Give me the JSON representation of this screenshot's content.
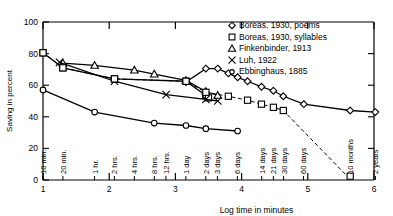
{
  "figure": {
    "y_axis_title": "Saving in percent",
    "x_axis_title": "Log time in minutes",
    "y_ticks": [
      "0",
      "20",
      "40",
      "60",
      "80",
      "100"
    ],
    "y_tick_values": [
      0,
      20,
      40,
      60,
      80,
      100
    ],
    "x_ticks": [
      "1",
      "2",
      "3",
      "4",
      "5",
      "6"
    ],
    "x_tick_values": [
      1,
      2,
      3,
      4,
      5,
      6
    ],
    "x_category_labels": [
      {
        "label": "10 min.",
        "log": 1.0
      },
      {
        "label": "20 min.",
        "log": 1.301
      },
      {
        "label": "1 hr.",
        "log": 1.778
      },
      {
        "label": "2 hrs.",
        "log": 2.079
      },
      {
        "label": "4 hrs.",
        "log": 2.38
      },
      {
        "label": "8 hrs.",
        "log": 2.681
      },
      {
        "label": "12 hrs.",
        "log": 2.857
      },
      {
        "label": "1 day",
        "log": 3.158
      },
      {
        "label": "2 days",
        "log": 3.459
      },
      {
        "label": "3 days",
        "log": 3.635
      },
      {
        "label": "6 days",
        "log": 3.936
      },
      {
        "label": "14 days",
        "log": 4.304
      },
      {
        "label": "21 days",
        "log": 4.48
      },
      {
        "label": "30 days",
        "log": 4.634
      },
      {
        "label": "60 days",
        "log": 4.935
      },
      {
        "label": "10 months",
        "log": 5.637
      },
      {
        "label": "2 years",
        "log": 6.021
      }
    ]
  },
  "legend": {
    "entries": [
      {
        "label": "Boreas, 1930, poems",
        "marker": "diamond"
      },
      {
        "label": "Boreas, 1930, syllables",
        "marker": "square"
      },
      {
        "label": "Finkenbinder, 1913",
        "marker": "triangle"
      },
      {
        "label": "Luh, 1922",
        "marker": "cross"
      },
      {
        "label": "Ebbinghaus, 1885",
        "marker": "circle-small"
      }
    ]
  },
  "chart_data": {
    "type": "line",
    "title": "",
    "xlabel": "Log time in minutes",
    "ylabel": "Saving in percent",
    "xlim": [
      1,
      6
    ],
    "ylim": [
      0,
      100
    ],
    "grid": false,
    "legend_position": "top-right",
    "x_is_log_minutes": true,
    "series": [
      {
        "name": "Boreas, 1930, poems",
        "marker": "diamond",
        "line": "solid",
        "points": [
          {
            "x": 3.16,
            "y": 62.0
          },
          {
            "x": 3.46,
            "y": 70.5
          },
          {
            "x": 3.64,
            "y": 70.5
          },
          {
            "x": 3.8,
            "y": 67.5
          },
          {
            "x": 3.94,
            "y": 65.0
          },
          {
            "x": 4.09,
            "y": 62.5
          },
          {
            "x": 4.3,
            "y": 59.0
          },
          {
            "x": 4.48,
            "y": 56.5
          },
          {
            "x": 4.63,
            "y": 53.0
          },
          {
            "x": 4.94,
            "y": 48.0
          },
          {
            "x": 5.64,
            "y": 44.0
          },
          {
            "x": 6.02,
            "y": 43.0
          }
        ]
      },
      {
        "name": "Boreas, 1930, syllables",
        "marker": "square",
        "line": "solid",
        "points": [
          {
            "x": 1.0,
            "y": 80.5
          },
          {
            "x": 1.3,
            "y": 71.0
          },
          {
            "x": 2.08,
            "y": 64.0
          },
          {
            "x": 3.16,
            "y": 62.5
          },
          {
            "x": 3.46,
            "y": 53.5
          },
          {
            "x": 3.5,
            "y": 52.0
          }
        ]
      },
      {
        "name": "Finkenbinder, 1913",
        "marker": "triangle",
        "line": "solid",
        "points": [
          {
            "x": 1.3,
            "y": 74.0
          },
          {
            "x": 1.78,
            "y": 72.5
          },
          {
            "x": 2.38,
            "y": 69.5
          },
          {
            "x": 2.68,
            "y": 67.0
          },
          {
            "x": 3.16,
            "y": 63.0
          },
          {
            "x": 3.46,
            "y": 56.0
          },
          {
            "x": 3.64,
            "y": 53.5
          }
        ]
      },
      {
        "name": "Luh, 1922",
        "marker": "cross",
        "line": "solid",
        "points": [
          {
            "x": 1.25,
            "y": 74.5
          },
          {
            "x": 2.08,
            "y": 62.5
          },
          {
            "x": 2.86,
            "y": 54.0
          },
          {
            "x": 3.46,
            "y": 51.0
          },
          {
            "x": 3.64,
            "y": 50.0
          }
        ]
      },
      {
        "name": "Ebbinghaus, 1885",
        "marker": "circle-small",
        "line": "solid",
        "points": [
          {
            "x": 1.0,
            "y": 57.0
          },
          {
            "x": 1.78,
            "y": 43.0
          },
          {
            "x": 2.68,
            "y": 36.0
          },
          {
            "x": 3.16,
            "y": 34.5
          },
          {
            "x": 3.46,
            "y": 32.5
          },
          {
            "x": 3.94,
            "y": 31.0
          }
        ]
      },
      {
        "name": "Ebbinghaus, 1885 (dashed extension)",
        "marker": "square",
        "line": "dashed",
        "points": [
          {
            "x": 1.0,
            "y": 80.5
          },
          {
            "x": 1.3,
            "y": 71.0
          },
          {
            "x": 2.08,
            "y": 64.0
          },
          {
            "x": 3.16,
            "y": 62.5
          },
          {
            "x": 3.46,
            "y": 55.5
          },
          {
            "x": 3.8,
            "y": 53.0
          },
          {
            "x": 4.09,
            "y": 50.5
          },
          {
            "x": 4.3,
            "y": 48.0
          },
          {
            "x": 4.48,
            "y": 46.0
          },
          {
            "x": 4.63,
            "y": 44.0
          },
          {
            "x": 5.64,
            "y": 0.5
          }
        ]
      }
    ]
  }
}
